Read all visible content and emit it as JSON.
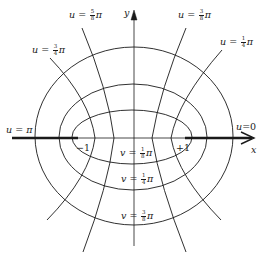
{
  "figure": {
    "axes": {
      "x_label": "x",
      "y_label": "y",
      "foci": [
        {
          "label": "−1",
          "x": -1
        },
        {
          "label": "+1",
          "x": 1
        }
      ]
    },
    "u_labels": [
      {
        "id": "u_pi",
        "var": "u",
        "eq": " = ",
        "value": "π",
        "num": "",
        "den": ""
      },
      {
        "id": "u_3_4",
        "var": "u",
        "eq": " = ",
        "num": "3",
        "den": "4",
        "value": "π"
      },
      {
        "id": "u_5_8",
        "var": "u",
        "eq": " = ",
        "num": "5",
        "den": "8",
        "value": "π"
      },
      {
        "id": "u_3_8",
        "var": "u",
        "eq": " = ",
        "num": "3",
        "den": "8",
        "value": "π"
      },
      {
        "id": "u_1_4",
        "var": "u",
        "eq": " = ",
        "num": "1",
        "den": "4",
        "value": "π"
      },
      {
        "id": "u_0",
        "var": "u",
        "eq": "=",
        "value": "0",
        "num": "",
        "den": ""
      }
    ],
    "v_labels": [
      {
        "id": "v_1_8",
        "var": "v",
        "eq": " = ",
        "num": "1",
        "den": "8",
        "value": "π"
      },
      {
        "id": "v_1_4",
        "var": "v",
        "eq": " = ",
        "num": "1",
        "den": "4",
        "value": "π"
      },
      {
        "id": "v_3_8",
        "var": "v",
        "eq": " = ",
        "num": "3",
        "den": "8",
        "value": "π"
      }
    ],
    "colors": {
      "ink": "#1a1a1a",
      "background": "#ffffff"
    }
  }
}
